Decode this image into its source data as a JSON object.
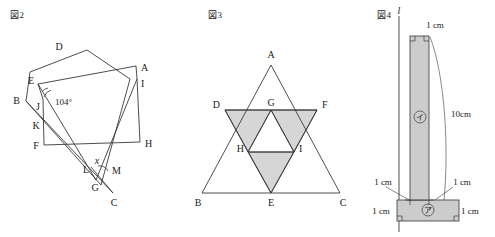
{
  "figures": [
    {
      "caption": "図2",
      "name": "overlapping-polygons-angle-problem",
      "vertex_labels": [
        "D",
        "A",
        "E",
        "B",
        "I",
        "J",
        "K",
        "F",
        "H",
        "L",
        "M",
        "G",
        "C"
      ],
      "annotations": {
        "angle_known": "104°",
        "angle_unknown": "x"
      }
    },
    {
      "caption": "図3",
      "name": "nested-equilateral-triangles",
      "vertex_labels": [
        "A",
        "D",
        "G",
        "F",
        "H",
        "I",
        "B",
        "E",
        "C"
      ],
      "shaded_regions": [
        "D-H-G",
        "G-I-F",
        "H-E-I"
      ]
    },
    {
      "caption": "図4",
      "name": "t-shaped-solid-rotation",
      "axis_label": "l",
      "part_labels": [
        "ア",
        "イ"
      ],
      "dimensions": {
        "top_width": "1 cm",
        "stem_height": "10cm",
        "left_base": "1 cm",
        "right_base": "1 cm",
        "base_height": "1 cm",
        "base_right": "1 cm"
      }
    }
  ]
}
